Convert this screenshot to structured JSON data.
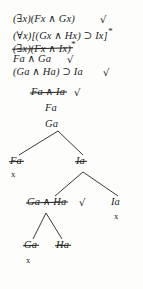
{
  "document": {
    "kind": "logic-truth-tree",
    "background_color": "#fdfdfc",
    "ink_color": "#201e1c"
  },
  "stem": {
    "lines": [
      {
        "id": "line-1",
        "text": "(∃x)(Fx ∧ Gx)",
        "mark": "√",
        "struck": false,
        "starred": false
      },
      {
        "id": "line-2",
        "text": "(∀x)[(Gx ∧ Hx) ⊃ Ix]",
        "mark": "",
        "struck": false,
        "starred": true
      },
      {
        "id": "line-3",
        "text": "(∃x)(Fx ∧ Ix)",
        "mark": "",
        "struck": true,
        "starred": true
      },
      {
        "id": "line-4",
        "text": "Fa ∧ Ga",
        "mark": "√",
        "struck": false,
        "starred": false
      },
      {
        "id": "line-5",
        "text": "(Ga ∧ Ha) ⊃ Ia",
        "mark": "√",
        "struck": false,
        "starred": false
      },
      {
        "id": "line-6",
        "text": "Fa ∧ Ia",
        "mark": "√",
        "struck": true,
        "starred": false
      },
      {
        "id": "line-7",
        "text": "Fa",
        "mark": "",
        "struck": false,
        "starred": false
      },
      {
        "id": "line-8",
        "text": "Ga",
        "mark": "",
        "struck": false,
        "starred": false
      }
    ]
  },
  "branches": {
    "level_1": [
      {
        "id": "node-fa-left",
        "text": "Fa",
        "struck": true,
        "closed": true,
        "close_mark": "x",
        "mark": ""
      },
      {
        "id": "node-ia-right",
        "text": "Ia",
        "struck": true,
        "closed": false,
        "close_mark": "",
        "mark": ""
      }
    ],
    "level_2": [
      {
        "id": "node-ga-ha",
        "text": "Ga ∧ Ha",
        "struck": true,
        "closed": false,
        "close_mark": "",
        "mark": "√"
      },
      {
        "id": "node-ia-leaf",
        "text": "Ia",
        "struck": false,
        "closed": true,
        "close_mark": "x",
        "mark": ""
      }
    ],
    "level_3": [
      {
        "id": "node-ga-leaf",
        "text": "Ga",
        "struck": true,
        "closed": true,
        "close_mark": "x",
        "mark": ""
      },
      {
        "id": "node-ha-leaf",
        "text": "Ha",
        "struck": true,
        "closed": false,
        "close_mark": "",
        "mark": ""
      }
    ]
  },
  "symbols": {
    "check": "√",
    "close": "x",
    "star": "*",
    "conjunction": "∧",
    "conditional": "⊃",
    "existential": "∃",
    "universal": "∀"
  }
}
